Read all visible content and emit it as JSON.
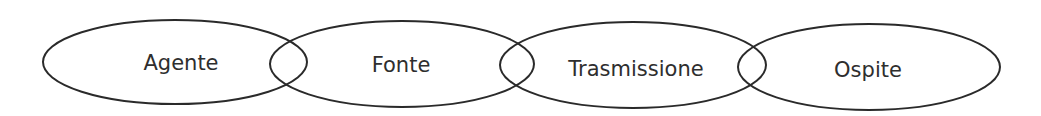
{
  "diagram": {
    "type": "overlapping-ellipse-chain",
    "stroke_color": "#2a2a2a",
    "text_color": "#2e2e2e",
    "background": "#ffffff",
    "nodes": [
      {
        "label": "Agente",
        "cx": 175,
        "cy": 62,
        "rx": 132,
        "ry": 42
      },
      {
        "label": "Fonte",
        "cx": 402,
        "cy": 64,
        "rx": 132,
        "ry": 43
      },
      {
        "label": "Trasmissione",
        "cx": 633,
        "cy": 65,
        "rx": 133,
        "ry": 43
      },
      {
        "label": "Ospite",
        "cx": 869,
        "cy": 67,
        "rx": 131,
        "ry": 43
      }
    ]
  }
}
